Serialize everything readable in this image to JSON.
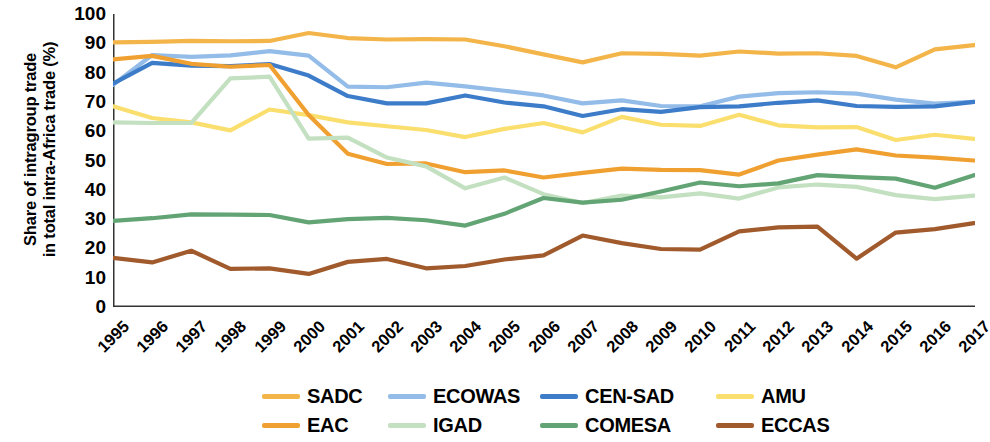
{
  "axis": {
    "ylabel_line1": "Share of intragroup trade",
    "ylabel_line2": "in total intra-Africa trade (%)",
    "yticks": [
      "0",
      "10",
      "20",
      "30",
      "40",
      "50",
      "60",
      "70",
      "80",
      "90",
      "100"
    ]
  },
  "legend": {
    "items": [
      {
        "label": "SADC",
        "color": "#f3b54a"
      },
      {
        "label": "ECOWAS",
        "color": "#93bce8"
      },
      {
        "label": "CEN-SAD",
        "color": "#3d7cc9"
      },
      {
        "label": "AMU",
        "color": "#fadf6e"
      },
      {
        "label": "EAC",
        "color": "#f0a030"
      },
      {
        "label": "IGAD",
        "color": "#c3e0c0"
      },
      {
        "label": "COMESA",
        "color": "#62a474"
      },
      {
        "label": "ECCAS",
        "color": "#a05a2c"
      }
    ]
  },
  "chart_data": {
    "type": "line",
    "title": "",
    "xlabel": "",
    "ylabel": "Share of intragroup trade in total intra-Africa trade (%)",
    "xlim": [
      1995,
      2017
    ],
    "ylim": [
      0,
      100
    ],
    "ytick_step": 10,
    "grid": false,
    "legend_position": "bottom",
    "categories": [
      "1995",
      "1996",
      "1997",
      "1998",
      "1999",
      "2000",
      "2001",
      "2002",
      "2003",
      "2004",
      "2005",
      "2006",
      "2007",
      "2008",
      "2009",
      "2010",
      "2011",
      "2012",
      "2013",
      "2014",
      "2015",
      "2016",
      "2017"
    ],
    "series": [
      {
        "name": "SADC",
        "color": "#f3b54a",
        "values": [
          90.3,
          90.5,
          90.8,
          90.7,
          90.8,
          93.5,
          91.8,
          91.3,
          91.4,
          91.3,
          89.0,
          86.2,
          83.5,
          86.6,
          86.4,
          85.8,
          87.2,
          86.5,
          86.6,
          85.7,
          81.8,
          87.9,
          89.4
        ]
      },
      {
        "name": "ECOWAS",
        "color": "#93bce8",
        "values": [
          75.8,
          86.0,
          85.4,
          85.9,
          87.3,
          85.8,
          75.2,
          75.0,
          76.6,
          75.3,
          73.8,
          72.2,
          69.5,
          70.5,
          68.6,
          68.5,
          71.8,
          73.0,
          73.3,
          72.8,
          70.8,
          69.4,
          70.0
        ]
      },
      {
        "name": "CEN-SAD",
        "color": "#3d7cc9",
        "values": [
          76.2,
          83.3,
          82.4,
          82.2,
          82.9,
          79.0,
          72.0,
          69.5,
          69.5,
          72.2,
          69.8,
          68.5,
          65.2,
          67.5,
          66.6,
          68.2,
          68.5,
          69.7,
          70.5,
          68.6,
          68.3,
          68.5,
          70.0
        ]
      },
      {
        "name": "AMU",
        "color": "#fadf6e",
        "values": [
          68.5,
          64.5,
          63.0,
          60.3,
          67.4,
          65.5,
          63.0,
          61.7,
          60.4,
          58.0,
          60.8,
          62.8,
          59.6,
          64.9,
          62.2,
          61.8,
          65.6,
          62.0,
          61.3,
          61.4,
          57.0,
          58.8,
          57.4
        ]
      },
      {
        "name": "EAC",
        "color": "#f0a030",
        "values": [
          84.5,
          85.7,
          83.0,
          82.0,
          82.6,
          65.5,
          52.3,
          48.8,
          49.0,
          46.0,
          46.6,
          44.2,
          45.8,
          47.2,
          46.8,
          46.7,
          45.2,
          50.0,
          52.0,
          53.8,
          51.7,
          51.0,
          50.0
        ]
      },
      {
        "name": "IGAD",
        "color": "#c3e0c0",
        "values": [
          63.0,
          62.8,
          62.8,
          78.0,
          78.6,
          57.5,
          57.8,
          51.0,
          48.0,
          40.5,
          44.2,
          38.5,
          35.5,
          38.0,
          37.4,
          38.8,
          37.0,
          40.8,
          41.8,
          41.0,
          38.2,
          36.8,
          38.0
        ]
      },
      {
        "name": "COMESA",
        "color": "#62a474",
        "values": [
          29.4,
          30.3,
          31.6,
          31.5,
          31.4,
          28.9,
          30.0,
          30.4,
          29.6,
          27.8,
          31.8,
          37.2,
          35.6,
          36.6,
          39.4,
          42.5,
          41.2,
          42.2,
          45.0,
          44.3,
          43.8,
          40.7,
          45.0
        ]
      },
      {
        "name": "ECCAS",
        "color": "#a05a2c",
        "values": [
          16.8,
          15.2,
          19.2,
          13.0,
          13.2,
          11.3,
          15.4,
          16.4,
          13.2,
          14.0,
          16.2,
          17.6,
          24.4,
          21.8,
          19.8,
          19.6,
          25.8,
          27.2,
          27.4,
          16.5,
          25.4,
          26.6,
          28.6
        ]
      }
    ]
  }
}
